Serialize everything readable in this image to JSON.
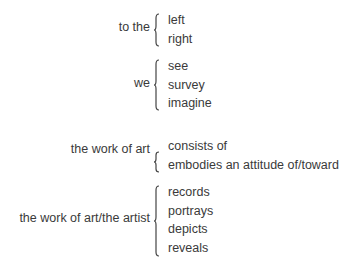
{
  "groups": [
    {
      "label": "to the",
      "options": [
        "left",
        "right"
      ]
    },
    {
      "label": "we",
      "options": [
        "see",
        "survey",
        "imagine"
      ]
    },
    {
      "label": "the work of art",
      "options": [
        "consists of",
        "embodies an attitude of/toward"
      ]
    },
    {
      "label": "the work of art/the artist",
      "options": [
        "records",
        "portrays",
        "depicts",
        "reveals"
      ]
    }
  ]
}
